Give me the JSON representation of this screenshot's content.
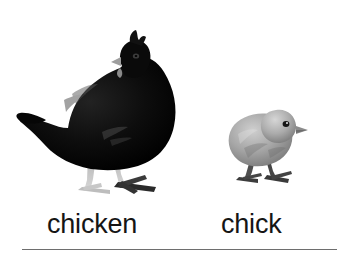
{
  "card": {
    "background_color": "#ffffff",
    "width": 337,
    "height": 258
  },
  "items": [
    {
      "label": "chicken",
      "icon": "black-hen-photo",
      "subject": "adult chicken (hen)",
      "body_color": "#0b0b0b",
      "leg_color": "#c9c9c9",
      "facing": "right"
    },
    {
      "label": "chick",
      "icon": "gray-chick-photo",
      "subject": "baby chicken (chick)",
      "body_color": "#9a9a9a",
      "leg_color": "#4a4a4a",
      "facing": "right"
    }
  ],
  "divider": {
    "color": "#6e6e6e"
  }
}
